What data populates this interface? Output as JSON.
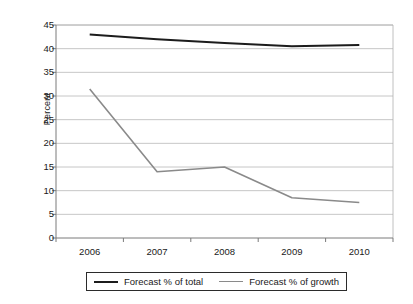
{
  "chart_data": {
    "type": "line",
    "title": "",
    "subtitle": "",
    "xlabel": "",
    "ylabel": "Percent",
    "categories": [
      "2006",
      "2007",
      "2008",
      "2009",
      "2010"
    ],
    "ylim": [
      0,
      45
    ],
    "ytick_step": 5,
    "yticks": [
      "0",
      "5",
      "10",
      "15",
      "20",
      "25",
      "30",
      "35",
      "40",
      "45"
    ],
    "grid": "horizontal",
    "legend_position": "bottom",
    "series": [
      {
        "name": "Forecast % of total",
        "color": "#1c1c1c",
        "values": [
          43,
          42,
          41.2,
          40.5,
          40.8
        ]
      },
      {
        "name": "Forecast % of growth",
        "color": "#8a8a8a",
        "values": [
          31.5,
          14,
          15,
          8.5,
          7.5
        ]
      }
    ]
  },
  "legend": {
    "entries": [
      {
        "label": "Forecast % of total"
      },
      {
        "label": "Forecast % of growth"
      }
    ]
  },
  "colors": {
    "series_total": "#1c1c1c",
    "series_growth": "#8a8a8a",
    "grid": "#b8b8b8",
    "axis": "#7a7a7a",
    "frame": "#b0b0b0",
    "text": "#1a1a1a",
    "background": "#ffffff"
  }
}
